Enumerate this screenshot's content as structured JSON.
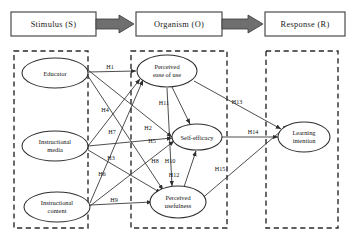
{
  "diagram": {
    "stages": [
      {
        "id": "stimulus",
        "label": "Stimulus  (S)"
      },
      {
        "id": "organism",
        "label": "Organism  (O)"
      },
      {
        "id": "response",
        "label": "Response  (R)"
      }
    ],
    "groups": [
      {
        "id": "stimulus-group",
        "x": 14,
        "y": 51,
        "w": 74,
        "h": 177
      },
      {
        "id": "organism-group",
        "x": 131,
        "y": 51,
        "w": 96,
        "h": 177
      },
      {
        "id": "response-group",
        "x": 266,
        "y": 51,
        "w": 72,
        "h": 177
      }
    ],
    "nodes": [
      {
        "id": "educator",
        "line1": "Educator",
        "line2": "",
        "cx": 55,
        "cy": 73,
        "rx": 33,
        "ry": 15
      },
      {
        "id": "instructional-media",
        "line1": "Instructional",
        "line2": "media",
        "cx": 55,
        "cy": 146,
        "rx": 33,
        "ry": 15
      },
      {
        "id": "instructional-content",
        "line1": "Instructional",
        "line2": "content",
        "cx": 57,
        "cy": 207,
        "rx": 33,
        "ry": 15
      },
      {
        "id": "perceived-ease-of-use",
        "line1": "Perceived",
        "line2": "ease of use",
        "cx": 167,
        "cy": 71,
        "rx": 30,
        "ry": 16
      },
      {
        "id": "self-efficacy",
        "line1": "Self-efficacy",
        "line2": "",
        "cx": 197,
        "cy": 137,
        "rx": 25,
        "ry": 13
      },
      {
        "id": "perceived-usefulness",
        "line1": "Perceived",
        "line2": "usefulness",
        "cx": 178,
        "cy": 202,
        "rx": 28,
        "ry": 16
      },
      {
        "id": "learning-intention",
        "line1": "Learning",
        "line2": "intention",
        "cx": 304,
        "cy": 137,
        "rx": 26,
        "ry": 15
      }
    ],
    "paths": [
      {
        "id": "H1",
        "label": "H1",
        "lx": 110,
        "ly": 69,
        "d": "M 88 72 L 136 71"
      },
      {
        "id": "H2",
        "label": "H2",
        "lx": 148,
        "ly": 130,
        "d": "M 88 70 L 172 137"
      },
      {
        "id": "H3",
        "label": "H3",
        "lx": 111,
        "ly": 160,
        "d": "M 88 76 L 163 190"
      },
      {
        "id": "H4",
        "label": "H4",
        "lx": 105,
        "ly": 112,
        "d": "M 88 146 L 140 79"
      },
      {
        "id": "H5",
        "label": "H5",
        "lx": 152,
        "ly": 143,
        "d": "M 88 146 L 172 138"
      },
      {
        "id": "H6",
        "label": "H6",
        "lx": 102,
        "ly": 176,
        "d": "M 88 150 L 161 193"
      },
      {
        "id": "H7",
        "label": "H7",
        "lx": 112,
        "ly": 134,
        "d": "M 90 203 L 143 80"
      },
      {
        "id": "H8",
        "label": "H8",
        "lx": 155,
        "ly": 163,
        "d": "M 90 206 L 174 141"
      },
      {
        "id": "H9",
        "label": "H9",
        "lx": 114,
        "ly": 202,
        "d": "M 90 205 L 152 202"
      },
      {
        "id": "H10",
        "label": "H10",
        "lx": 170,
        "ly": 163,
        "d": "M 167 88 L 172 186"
      },
      {
        "id": "H11",
        "label": "H11",
        "lx": 164,
        "ly": 105,
        "d": "M 172 87 L 190 124"
      },
      {
        "id": "H12",
        "label": "H12",
        "lx": 174,
        "ly": 177,
        "d": "M 184 187 L 196 151"
      },
      {
        "id": "H13",
        "label": "H13",
        "lx": 237,
        "ly": 104,
        "d": "M 194 81 L 281 129"
      },
      {
        "id": "H14",
        "label": "H14",
        "lx": 253,
        "ly": 134,
        "d": "M 222 137 L 278 137"
      },
      {
        "id": "H15",
        "label": "H15",
        "lx": 220,
        "ly": 171,
        "d": "M 179 218 L 288 125"
      }
    ]
  }
}
